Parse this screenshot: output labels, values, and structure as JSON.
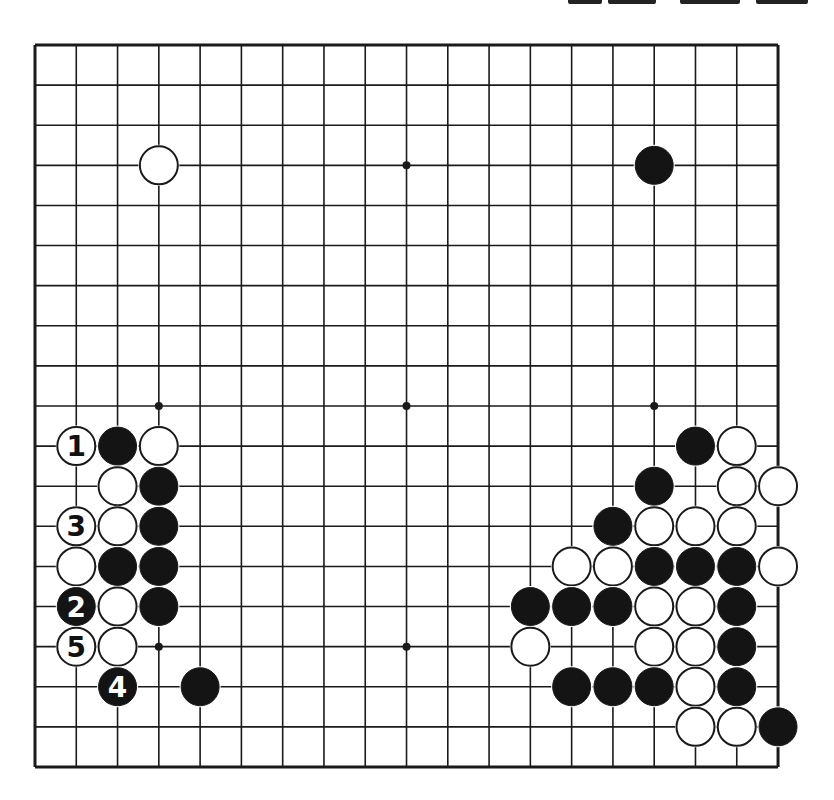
{
  "board": {
    "size": 19,
    "origin": {
      "x": 35,
      "y": 45
    },
    "spacing": {
      "x": 41.28,
      "y": 40.11
    },
    "stone_radius": 19,
    "line_color": "#1a1a1a",
    "black_color": "#141414",
    "white_color": "#ffffff",
    "hoshi": [
      [
        3,
        3
      ],
      [
        9,
        3
      ],
      [
        15,
        3
      ],
      [
        3,
        9
      ],
      [
        9,
        9
      ],
      [
        15,
        9
      ],
      [
        3,
        15
      ],
      [
        9,
        15
      ],
      [
        15,
        15
      ]
    ],
    "stones": [
      {
        "col": 3,
        "row": 3,
        "color": "white",
        "label": ""
      },
      {
        "col": 15,
        "row": 3,
        "color": "black",
        "label": ""
      },
      {
        "col": 1,
        "row": 10,
        "color": "white",
        "label": "1"
      },
      {
        "col": 2,
        "row": 10,
        "color": "black",
        "label": ""
      },
      {
        "col": 3,
        "row": 10,
        "color": "white",
        "label": ""
      },
      {
        "col": 2,
        "row": 11,
        "color": "white",
        "label": ""
      },
      {
        "col": 3,
        "row": 11,
        "color": "black",
        "label": ""
      },
      {
        "col": 1,
        "row": 12,
        "color": "white",
        "label": "3"
      },
      {
        "col": 2,
        "row": 12,
        "color": "white",
        "label": ""
      },
      {
        "col": 3,
        "row": 12,
        "color": "black",
        "label": ""
      },
      {
        "col": 1,
        "row": 13,
        "color": "white",
        "label": ""
      },
      {
        "col": 2,
        "row": 13,
        "color": "black",
        "label": ""
      },
      {
        "col": 3,
        "row": 13,
        "color": "black",
        "label": ""
      },
      {
        "col": 1,
        "row": 14,
        "color": "black",
        "label": "2"
      },
      {
        "col": 2,
        "row": 14,
        "color": "white",
        "label": ""
      },
      {
        "col": 3,
        "row": 14,
        "color": "black",
        "label": ""
      },
      {
        "col": 1,
        "row": 15,
        "color": "white",
        "label": "5"
      },
      {
        "col": 2,
        "row": 15,
        "color": "white",
        "label": ""
      },
      {
        "col": 2,
        "row": 16,
        "color": "black",
        "label": "4"
      },
      {
        "col": 4,
        "row": 16,
        "color": "black",
        "label": ""
      },
      {
        "col": 16,
        "row": 10,
        "color": "black",
        "label": ""
      },
      {
        "col": 17,
        "row": 10,
        "color": "white",
        "label": ""
      },
      {
        "col": 15,
        "row": 11,
        "color": "black",
        "label": ""
      },
      {
        "col": 17,
        "row": 11,
        "color": "white",
        "label": ""
      },
      {
        "col": 18,
        "row": 11,
        "color": "white",
        "label": ""
      },
      {
        "col": 14,
        "row": 12,
        "color": "black",
        "label": ""
      },
      {
        "col": 15,
        "row": 12,
        "color": "white",
        "label": ""
      },
      {
        "col": 16,
        "row": 12,
        "color": "white",
        "label": ""
      },
      {
        "col": 17,
        "row": 12,
        "color": "white",
        "label": ""
      },
      {
        "col": 13,
        "row": 13,
        "color": "white",
        "label": ""
      },
      {
        "col": 14,
        "row": 13,
        "color": "white",
        "label": ""
      },
      {
        "col": 15,
        "row": 13,
        "color": "black",
        "label": ""
      },
      {
        "col": 16,
        "row": 13,
        "color": "black",
        "label": ""
      },
      {
        "col": 17,
        "row": 13,
        "color": "black",
        "label": ""
      },
      {
        "col": 18,
        "row": 13,
        "color": "white",
        "label": ""
      },
      {
        "col": 12,
        "row": 14,
        "color": "black",
        "label": ""
      },
      {
        "col": 13,
        "row": 14,
        "color": "black",
        "label": ""
      },
      {
        "col": 14,
        "row": 14,
        "color": "black",
        "label": ""
      },
      {
        "col": 15,
        "row": 14,
        "color": "white",
        "label": ""
      },
      {
        "col": 16,
        "row": 14,
        "color": "white",
        "label": ""
      },
      {
        "col": 17,
        "row": 14,
        "color": "black",
        "label": ""
      },
      {
        "col": 12,
        "row": 15,
        "color": "white",
        "label": ""
      },
      {
        "col": 15,
        "row": 15,
        "color": "white",
        "label": ""
      },
      {
        "col": 16,
        "row": 15,
        "color": "white",
        "label": ""
      },
      {
        "col": 17,
        "row": 15,
        "color": "black",
        "label": ""
      },
      {
        "col": 13,
        "row": 16,
        "color": "black",
        "label": ""
      },
      {
        "col": 14,
        "row": 16,
        "color": "black",
        "label": ""
      },
      {
        "col": 15,
        "row": 16,
        "color": "black",
        "label": ""
      },
      {
        "col": 16,
        "row": 16,
        "color": "white",
        "label": ""
      },
      {
        "col": 17,
        "row": 16,
        "color": "black",
        "label": ""
      },
      {
        "col": 16,
        "row": 17,
        "color": "white",
        "label": ""
      },
      {
        "col": 17,
        "row": 17,
        "color": "white",
        "label": ""
      },
      {
        "col": 18,
        "row": 17,
        "color": "black",
        "label": ""
      }
    ]
  }
}
